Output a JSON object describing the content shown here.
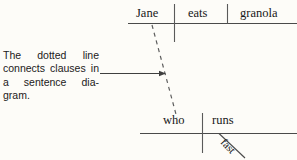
{
  "figure": {
    "background_color": "#fdfcf8",
    "ink_color": "#3c3c3c",
    "text_color": "#171717"
  },
  "caption": {
    "full_text": "The dotted line connects clauses in a sentence diagram.",
    "lines": [
      {
        "words": [
          "The",
          "dotted",
          "line"
        ]
      },
      {
        "words": [
          "connects",
          "clauses",
          "in"
        ]
      },
      {
        "words": [
          "a",
          "sentence",
          "dia-"
        ]
      },
      {
        "words": [
          "gram."
        ]
      }
    ],
    "line1_word1": "The",
    "line1_word2": "dotted",
    "line1_word3": "line",
    "line2_word1": "connects",
    "line2_word2": "clauses",
    "line2_word3": "in",
    "line3_word1": "a",
    "line3_word2": "sentence",
    "line3_word3": "dia-",
    "line4_word1": "gram."
  },
  "pointer": {
    "description": "arrow from caption to dotted connector line",
    "direction": "right"
  },
  "main_clause": {
    "subject": "Jane",
    "verb": "eats",
    "object": "granola",
    "baseline_y": 23,
    "subject_verb_divider": "crosses-baseline",
    "verb_object_divider": "stops-at-baseline"
  },
  "relative_clause": {
    "subject": "who",
    "verb": "runs",
    "modifier": "fast",
    "baseline_y": 133,
    "subject_verb_divider": "crosses-baseline",
    "modifier_line": "diagonal"
  },
  "connector": {
    "style": "dotted",
    "from": "Jane",
    "to": "who"
  }
}
